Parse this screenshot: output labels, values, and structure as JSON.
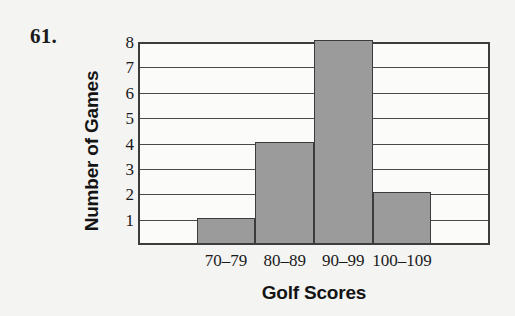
{
  "problem": {
    "number_label": "61."
  },
  "chart_data": {
    "type": "bar",
    "title": "",
    "xlabel": "Golf Scores",
    "ylabel": "Number of Games",
    "categories": [
      "70–79",
      "80–89",
      "90–99",
      "100–109"
    ],
    "values": [
      1,
      4,
      8,
      2
    ],
    "ylim": [
      0,
      8
    ],
    "yticks": [
      1,
      2,
      3,
      4,
      5,
      6,
      7,
      8
    ],
    "ytick_labels": [
      "1",
      "2",
      "3",
      "4",
      "5",
      "6",
      "7",
      "8"
    ],
    "grid": true,
    "grid_axis": "y",
    "legend": false,
    "bar_fill_color": "#9b9b9b",
    "bar_edge_color": "#3c3c3c",
    "axis_color": "#3c3c3c",
    "background_color": "#f4f4f3",
    "plot_background_color": "#fbfbfa",
    "leading_empty_slots": 1,
    "trailing_empty_slots": 1
  }
}
